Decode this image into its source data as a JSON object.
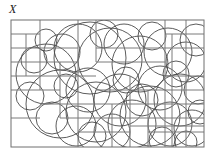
{
  "figure": {
    "label": "X",
    "label_style": "italic-serif",
    "caption": ""
  },
  "colors": {
    "background": "#ffffff",
    "frame_stroke": "#6f6f6f",
    "grid_stroke": "#7a7a7a",
    "circle_stroke": "#4a4a4a",
    "label_color": "#1a1a1a"
  },
  "chart_data": {
    "type": "diagram",
    "title": "X",
    "xlabel": "",
    "ylabel": "",
    "xlim": [
      11,
      204
    ],
    "ylim": [
      20,
      147
    ],
    "grid": true,
    "legend": "none",
    "frame": {
      "x": 11,
      "y": 20,
      "width": 193,
      "height": 127
    },
    "segments": [
      {
        "x1": 11,
        "y1": 34,
        "x2": 40,
        "y2": 34
      },
      {
        "x1": 11,
        "y1": 48,
        "x2": 78,
        "y2": 48
      },
      {
        "x1": 11,
        "y1": 62,
        "x2": 78,
        "y2": 62
      },
      {
        "x1": 11,
        "y1": 76,
        "x2": 96,
        "y2": 76
      },
      {
        "x1": 11,
        "y1": 90,
        "x2": 60,
        "y2": 90
      },
      {
        "x1": 40,
        "y1": 20,
        "x2": 40,
        "y2": 90
      },
      {
        "x1": 26,
        "y1": 34,
        "x2": 26,
        "y2": 76
      },
      {
        "x1": 60,
        "y1": 62,
        "x2": 60,
        "y2": 118
      },
      {
        "x1": 78,
        "y1": 20,
        "x2": 78,
        "y2": 147
      },
      {
        "x1": 96,
        "y1": 20,
        "x2": 96,
        "y2": 62
      },
      {
        "x1": 40,
        "y1": 104,
        "x2": 204,
        "y2": 104
      },
      {
        "x1": 60,
        "y1": 118,
        "x2": 204,
        "y2": 118
      },
      {
        "x1": 96,
        "y1": 90,
        "x2": 204,
        "y2": 90
      },
      {
        "x1": 96,
        "y1": 62,
        "x2": 165,
        "y2": 62
      },
      {
        "x1": 96,
        "y1": 48,
        "x2": 204,
        "y2": 48
      },
      {
        "x1": 112,
        "y1": 104,
        "x2": 112,
        "y2": 147
      },
      {
        "x1": 130,
        "y1": 76,
        "x2": 130,
        "y2": 147
      },
      {
        "x1": 148,
        "y1": 90,
        "x2": 148,
        "y2": 147
      },
      {
        "x1": 165,
        "y1": 20,
        "x2": 165,
        "y2": 147
      },
      {
        "x1": 172,
        "y1": 34,
        "x2": 172,
        "y2": 147
      },
      {
        "x1": 186,
        "y1": 20,
        "x2": 186,
        "y2": 147
      },
      {
        "x1": 165,
        "y1": 34,
        "x2": 204,
        "y2": 34
      },
      {
        "x1": 165,
        "y1": 76,
        "x2": 204,
        "y2": 76
      },
      {
        "x1": 148,
        "y1": 132,
        "x2": 204,
        "y2": 132
      },
      {
        "x1": 130,
        "y1": 126,
        "x2": 204,
        "y2": 126
      },
      {
        "x1": 78,
        "y1": 132,
        "x2": 130,
        "y2": 132
      },
      {
        "x1": 11,
        "y1": 118,
        "x2": 40,
        "y2": 118
      }
    ],
    "circles": [
      {
        "cx": 46,
        "cy": 74,
        "r": 30
      },
      {
        "cx": 62,
        "cy": 52,
        "r": 18
      },
      {
        "cx": 34,
        "cy": 60,
        "r": 13
      },
      {
        "cx": 90,
        "cy": 58,
        "r": 36
      },
      {
        "cx": 110,
        "cy": 60,
        "r": 32
      },
      {
        "cx": 78,
        "cy": 48,
        "r": 24
      },
      {
        "cx": 60,
        "cy": 104,
        "r": 34
      },
      {
        "cx": 96,
        "cy": 112,
        "r": 30
      },
      {
        "cx": 88,
        "cy": 90,
        "r": 22
      },
      {
        "cx": 120,
        "cy": 100,
        "r": 26
      },
      {
        "cx": 140,
        "cy": 64,
        "r": 28
      },
      {
        "cx": 168,
        "cy": 52,
        "r": 24
      },
      {
        "cx": 186,
        "cy": 62,
        "r": 20
      },
      {
        "cx": 196,
        "cy": 40,
        "r": 16
      },
      {
        "cx": 160,
        "cy": 88,
        "r": 22
      },
      {
        "cx": 180,
        "cy": 100,
        "r": 26
      },
      {
        "cx": 150,
        "cy": 116,
        "r": 30
      },
      {
        "cx": 170,
        "cy": 124,
        "r": 22
      },
      {
        "cx": 192,
        "cy": 128,
        "r": 18
      },
      {
        "cx": 132,
        "cy": 124,
        "r": 24
      },
      {
        "cx": 112,
        "cy": 132,
        "r": 18
      },
      {
        "cx": 76,
        "cy": 126,
        "r": 20
      },
      {
        "cx": 52,
        "cy": 118,
        "r": 16
      },
      {
        "cx": 30,
        "cy": 96,
        "r": 14
      },
      {
        "cx": 124,
        "cy": 44,
        "r": 20
      },
      {
        "cx": 104,
        "cy": 34,
        "r": 14
      },
      {
        "cx": 152,
        "cy": 36,
        "r": 14
      },
      {
        "cx": 198,
        "cy": 90,
        "r": 14
      },
      {
        "cx": 142,
        "cy": 100,
        "r": 16
      },
      {
        "cx": 92,
        "cy": 136,
        "r": 14
      },
      {
        "cx": 66,
        "cy": 86,
        "r": 12
      },
      {
        "cx": 176,
        "cy": 74,
        "r": 13
      },
      {
        "cx": 200,
        "cy": 112,
        "r": 12
      },
      {
        "cx": 126,
        "cy": 80,
        "r": 13
      },
      {
        "cx": 46,
        "cy": 40,
        "r": 11
      },
      {
        "cx": 162,
        "cy": 140,
        "r": 13
      },
      {
        "cx": 186,
        "cy": 142,
        "r": 11
      }
    ]
  }
}
